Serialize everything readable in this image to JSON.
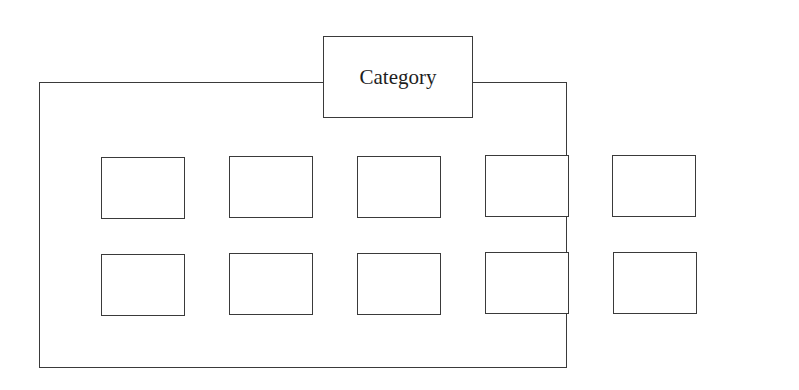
{
  "diagram": {
    "category_label": "Category",
    "rows": 2,
    "columns": 5,
    "items": [
      {
        "row": 1,
        "col": 1,
        "label": ""
      },
      {
        "row": 1,
        "col": 2,
        "label": ""
      },
      {
        "row": 1,
        "col": 3,
        "label": ""
      },
      {
        "row": 1,
        "col": 4,
        "label": ""
      },
      {
        "row": 1,
        "col": 5,
        "label": ""
      },
      {
        "row": 2,
        "col": 1,
        "label": ""
      },
      {
        "row": 2,
        "col": 2,
        "label": ""
      },
      {
        "row": 2,
        "col": 3,
        "label": ""
      },
      {
        "row": 2,
        "col": 4,
        "label": ""
      },
      {
        "row": 2,
        "col": 5,
        "label": ""
      }
    ],
    "colors": {
      "stroke": "#3a3a3a",
      "background": "#ffffff",
      "text": "#1e1e1e"
    }
  }
}
